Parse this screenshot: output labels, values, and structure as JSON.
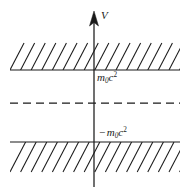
{
  "figure": {
    "background_color": "#ffffff",
    "stroke_color": "#1a1a1a",
    "width": 190,
    "height": 193
  },
  "axis": {
    "name": "vertical-energy-axis",
    "label": "V",
    "label_style": "italic",
    "x": 94,
    "y_top": 11,
    "y_bottom": 187,
    "arrow": "up",
    "arrow_tip_y": 11,
    "arrow_base_y": 26,
    "arrow_half_width": 4.5
  },
  "lines": {
    "upper_boundary": {
      "name": "positive-continuum-boundary",
      "y": 70,
      "x_start": 10,
      "x_end": 180,
      "style": "solid"
    },
    "middle_dashed": {
      "name": "zero-energy-dashed-line",
      "y": 103,
      "x_start": 10,
      "x_end": 180,
      "style": "dashed",
      "dash_pattern": "8,5"
    },
    "lower_boundary": {
      "name": "negative-continuum-boundary",
      "y": 142,
      "x_start": 10,
      "x_end": 180,
      "style": "solid"
    }
  },
  "hatching": {
    "upper_region": {
      "name": "positive-energy-continuum",
      "direction": "up-right",
      "y_top": 43,
      "y_bottom": 70,
      "x_start": 10,
      "x_end": 180,
      "spacing": 10.6,
      "count": 17
    },
    "lower_region": {
      "name": "negative-energy-continuum",
      "direction": "up-right",
      "y_top": 142,
      "y_bottom": 172,
      "x_start": 10,
      "x_end": 180,
      "spacing": 10.6,
      "count": 17
    }
  },
  "labels": {
    "axis": {
      "text": "V"
    },
    "positive_rest_energy": {
      "prefix": "",
      "base": "m",
      "sub": "0",
      "var": "c",
      "sup": "2",
      "full_text": "m0c2"
    },
    "negative_rest_energy": {
      "prefix": "−",
      "base": "m",
      "sub": "0",
      "var": "c",
      "sup": "2",
      "full_text": "− m0c2"
    }
  }
}
